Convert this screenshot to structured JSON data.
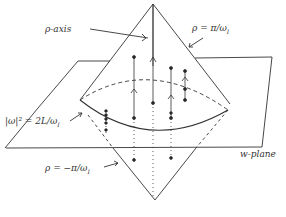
{
  "diagram": {
    "title": "",
    "labels": {
      "rho_axis": "ρ-axis",
      "rho_top": "ρ = π/ω",
      "rho_top_sub": "I",
      "rho_bottom": "ρ = −π/ω",
      "rho_bottom_sub": "I",
      "circle_eq": "|ω|² = 2L/ω",
      "circle_eq_sub": "I",
      "w_plane": "w-plane"
    },
    "elements": [
      "double-cone",
      "w-plane parallelogram",
      "intersection circle |w|^2 = 2L/omega_I",
      "vertical flow lines with arrows and dots"
    ],
    "colors": {
      "stroke": "#333333",
      "background": "#ffffff"
    }
  }
}
